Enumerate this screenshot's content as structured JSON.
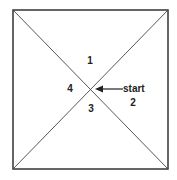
{
  "diagram": {
    "regions": [
      {
        "id": "region-1",
        "label": "1"
      },
      {
        "id": "region-2",
        "label": "2"
      },
      {
        "id": "region-3",
        "label": "3"
      },
      {
        "id": "region-4",
        "label": "4"
      }
    ],
    "start_label": "start",
    "colors": {
      "stroke": "#333333",
      "background": "#ffffff"
    }
  }
}
